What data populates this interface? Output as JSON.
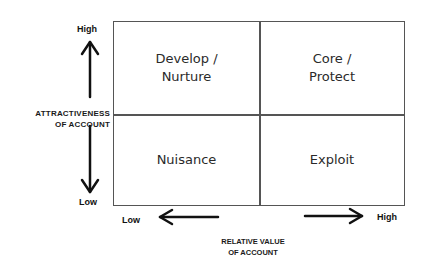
{
  "matrix": {
    "quadrants": {
      "top_left": "Develop /\nNurture",
      "top_right": "Core /\nProtect",
      "bottom_left": "Nuisance",
      "bottom_right": "Exploit"
    }
  },
  "y_axis": {
    "label_line1": "ATTRACTIVENESS",
    "label_line2": "OF ACCOUNT",
    "high": "High",
    "low": "Low"
  },
  "x_axis": {
    "label_line1": "RELATIVE VALUE",
    "label_line2": "OF ACCOUNT",
    "low": "Low",
    "high": "High"
  },
  "colors": {
    "line": "#555555",
    "text": "#1a1a1a",
    "background": "#ffffff"
  }
}
